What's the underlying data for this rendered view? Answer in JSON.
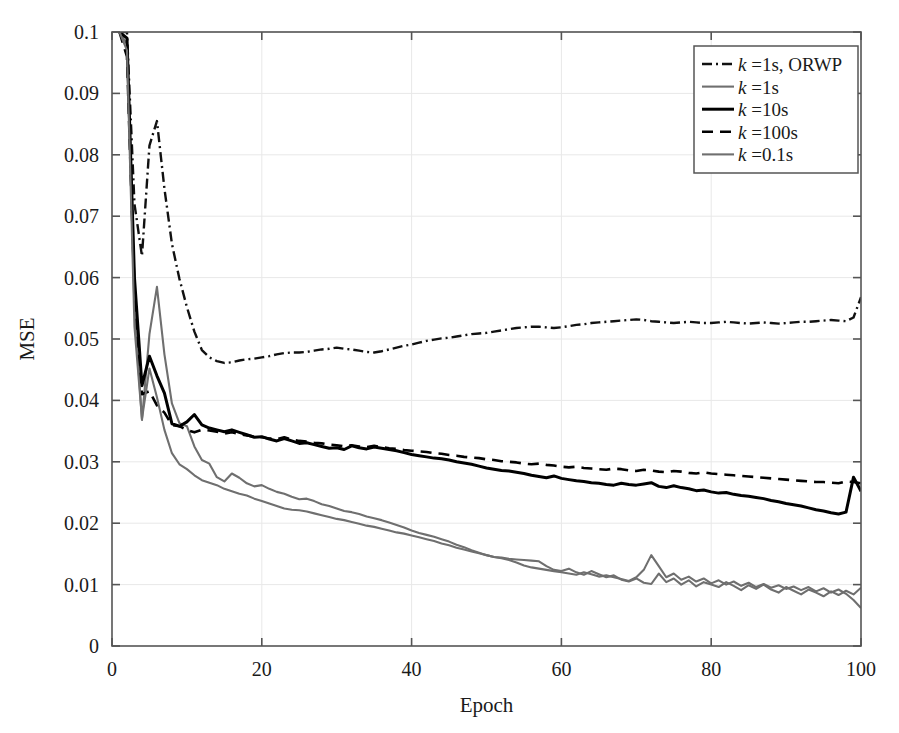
{
  "chart_data": {
    "type": "line",
    "title": "",
    "xlabel": "Epoch",
    "ylabel": "MSE",
    "xlim": [
      0,
      100
    ],
    "ylim": [
      0,
      0.1
    ],
    "xticks": [
      0,
      20,
      40,
      60,
      80,
      100
    ],
    "yticks": [
      0,
      0.01,
      0.02,
      0.03,
      0.04,
      0.05,
      0.06,
      0.07,
      0.08,
      0.09,
      0.1
    ],
    "xtick_labels": [
      "0",
      "20",
      "40",
      "60",
      "80",
      "100"
    ],
    "ytick_labels": [
      "0",
      "0.01",
      "0.02",
      "0.03",
      "0.04",
      "0.05",
      "0.06",
      "0.07",
      "0.08",
      "0.09",
      "0.1"
    ],
    "grid": true,
    "grid_color": "#e8e8e8",
    "axis_color": "#555555",
    "background": "#ffffff",
    "legend_position": "top-right",
    "x": [
      1,
      2,
      3,
      4,
      5,
      6,
      7,
      8,
      9,
      10,
      11,
      12,
      13,
      14,
      15,
      16,
      17,
      18,
      19,
      20,
      21,
      22,
      23,
      24,
      25,
      26,
      27,
      28,
      29,
      30,
      31,
      32,
      33,
      34,
      35,
      36,
      37,
      38,
      39,
      40,
      41,
      42,
      43,
      44,
      45,
      46,
      47,
      48,
      49,
      50,
      51,
      52,
      53,
      54,
      55,
      56,
      57,
      58,
      59,
      60,
      61,
      62,
      63,
      64,
      65,
      66,
      67,
      68,
      69,
      70,
      71,
      72,
      73,
      74,
      75,
      76,
      77,
      78,
      79,
      80,
      81,
      82,
      83,
      84,
      85,
      86,
      87,
      88,
      89,
      90,
      91,
      92,
      93,
      94,
      95,
      96,
      97,
      98,
      99,
      100
    ],
    "series": [
      {
        "name": "k =1s, ORWP",
        "label_k": "k",
        "label_rest": " =1s, ORWP",
        "color": "#111111",
        "width": 2.4,
        "dash": "10,4,2,4",
        "values": [
          0.148,
          0.101,
          0.072,
          0.0635,
          0.0815,
          0.0855,
          0.0745,
          0.0655,
          0.0598,
          0.0552,
          0.0512,
          0.0482,
          0.047,
          0.0464,
          0.0461,
          0.0462,
          0.0465,
          0.0467,
          0.0468,
          0.047,
          0.0472,
          0.0475,
          0.0477,
          0.0478,
          0.0478,
          0.0479,
          0.0481,
          0.0483,
          0.0484,
          0.0486,
          0.0484,
          0.0483,
          0.0481,
          0.0479,
          0.0478,
          0.048,
          0.0483,
          0.0486,
          0.0489,
          0.0491,
          0.0494,
          0.0497,
          0.0499,
          0.0501,
          0.0502,
          0.0504,
          0.0506,
          0.0508,
          0.0509,
          0.051,
          0.0512,
          0.0514,
          0.0516,
          0.0518,
          0.0519,
          0.052,
          0.052,
          0.0519,
          0.0518,
          0.0519,
          0.0521,
          0.0523,
          0.0524,
          0.0526,
          0.0527,
          0.0528,
          0.0529,
          0.053,
          0.0531,
          0.0532,
          0.0531,
          0.0529,
          0.0528,
          0.0527,
          0.0526,
          0.0527,
          0.0528,
          0.0527,
          0.0526,
          0.0526,
          0.0527,
          0.0528,
          0.0527,
          0.0526,
          0.0525,
          0.0526,
          0.0527,
          0.0526,
          0.0525,
          0.0526,
          0.0527,
          0.0528,
          0.0528,
          0.0529,
          0.053,
          0.0531,
          0.053,
          0.0529,
          0.0535,
          0.0568
        ]
      },
      {
        "name": "k =1s",
        "label_k": "k",
        "label_rest": " =1s",
        "color": "#6f6f6f",
        "width": 2.1,
        "dash": "none",
        "values": [
          0.139,
          0.098,
          0.055,
          0.0368,
          0.0508,
          0.0585,
          0.0475,
          0.0395,
          0.0363,
          0.0358,
          0.0325,
          0.0303,
          0.0297,
          0.0275,
          0.0268,
          0.0281,
          0.0274,
          0.0265,
          0.026,
          0.0262,
          0.0256,
          0.0251,
          0.0248,
          0.0243,
          0.0239,
          0.024,
          0.0236,
          0.0231,
          0.0228,
          0.0224,
          0.022,
          0.0218,
          0.0215,
          0.0211,
          0.0208,
          0.0205,
          0.0201,
          0.0197,
          0.0193,
          0.0188,
          0.0184,
          0.0181,
          0.0178,
          0.0174,
          0.017,
          0.0165,
          0.0161,
          0.0156,
          0.0152,
          0.0148,
          0.0145,
          0.0144,
          0.0142,
          0.0141,
          0.014,
          0.0139,
          0.0138,
          0.013,
          0.0124,
          0.0122,
          0.0126,
          0.012,
          0.0116,
          0.0122,
          0.0117,
          0.0112,
          0.0115,
          0.0108,
          0.0105,
          0.011,
          0.0103,
          0.0101,
          0.0118,
          0.0104,
          0.011,
          0.01,
          0.0107,
          0.0097,
          0.0104,
          0.01,
          0.0096,
          0.0104,
          0.0098,
          0.0091,
          0.0099,
          0.0093,
          0.01,
          0.0092,
          0.0087,
          0.0096,
          0.009,
          0.0084,
          0.0092,
          0.0087,
          0.0081,
          0.0089,
          0.0083,
          0.009,
          0.0084,
          0.0095
        ]
      },
      {
        "name": "k =10s",
        "label_k": "k",
        "label_rest": " =10s",
        "color": "#000000",
        "width": 3.0,
        "dash": "none",
        "values": [
          0.142,
          0.099,
          0.06,
          0.0424,
          0.0472,
          0.044,
          0.0412,
          0.0362,
          0.0358,
          0.0365,
          0.0377,
          0.036,
          0.0355,
          0.0352,
          0.0349,
          0.0352,
          0.0348,
          0.0344,
          0.034,
          0.0341,
          0.0337,
          0.0334,
          0.0338,
          0.0334,
          0.033,
          0.0331,
          0.0328,
          0.0325,
          0.0322,
          0.0323,
          0.032,
          0.0326,
          0.0323,
          0.0321,
          0.0324,
          0.0322,
          0.032,
          0.0318,
          0.0315,
          0.0312,
          0.031,
          0.0308,
          0.0306,
          0.0305,
          0.0303,
          0.03,
          0.0298,
          0.0296,
          0.0293,
          0.029,
          0.0288,
          0.0286,
          0.0285,
          0.0283,
          0.0281,
          0.0278,
          0.0276,
          0.0274,
          0.0277,
          0.0273,
          0.0271,
          0.0269,
          0.0268,
          0.0266,
          0.0265,
          0.0263,
          0.0262,
          0.0265,
          0.0263,
          0.0262,
          0.0264,
          0.0266,
          0.026,
          0.0258,
          0.0261,
          0.0258,
          0.0256,
          0.0253,
          0.0254,
          0.0251,
          0.0249,
          0.025,
          0.0247,
          0.0245,
          0.0244,
          0.0242,
          0.024,
          0.0237,
          0.0235,
          0.0232,
          0.023,
          0.0228,
          0.0225,
          0.0222,
          0.022,
          0.0217,
          0.0215,
          0.0218,
          0.0275,
          0.0252
        ]
      },
      {
        "name": "k =100s",
        "label_k": "k",
        "label_rest": " =100s",
        "color": "#000000",
        "width": 2.6,
        "dash": "11,7",
        "values": [
          0.133,
          0.096,
          0.058,
          0.041,
          0.0415,
          0.0392,
          0.038,
          0.036,
          0.0358,
          0.0352,
          0.0348,
          0.0352,
          0.0351,
          0.0349,
          0.0346,
          0.0348,
          0.0345,
          0.0343,
          0.0341,
          0.034,
          0.0338,
          0.0337,
          0.034,
          0.0336,
          0.0334,
          0.0333,
          0.0331,
          0.033,
          0.0328,
          0.0327,
          0.0325,
          0.0327,
          0.0325,
          0.0324,
          0.0326,
          0.0324,
          0.0322,
          0.0321,
          0.0319,
          0.0318,
          0.0317,
          0.0316,
          0.0314,
          0.0313,
          0.0311,
          0.031,
          0.0308,
          0.0307,
          0.0306,
          0.0304,
          0.0303,
          0.0301,
          0.03,
          0.0299,
          0.0297,
          0.0296,
          0.0297,
          0.0295,
          0.0294,
          0.0292,
          0.0291,
          0.0292,
          0.029,
          0.0289,
          0.0288,
          0.0287,
          0.0289,
          0.0288,
          0.0286,
          0.0285,
          0.0287,
          0.0286,
          0.0284,
          0.0283,
          0.0285,
          0.0284,
          0.0282,
          0.0281,
          0.0283,
          0.0281,
          0.028,
          0.0279,
          0.0278,
          0.0277,
          0.0276,
          0.0275,
          0.0274,
          0.0273,
          0.0272,
          0.0271,
          0.027,
          0.0269,
          0.0268,
          0.0267,
          0.0267,
          0.0266,
          0.0265,
          0.0268,
          0.0267,
          0.0265
        ]
      },
      {
        "name": "k =0.1s",
        "label_k": "k",
        "label_rest": " =0.1s",
        "color": "#6f6f6f",
        "width": 2.1,
        "dash": "none",
        "values": [
          0.135,
          0.097,
          0.052,
          0.037,
          0.0452,
          0.0405,
          0.0352,
          0.0314,
          0.0296,
          0.0288,
          0.0278,
          0.027,
          0.0266,
          0.0262,
          0.0256,
          0.0252,
          0.0248,
          0.0245,
          0.024,
          0.0236,
          0.0232,
          0.0228,
          0.0224,
          0.0222,
          0.0221,
          0.0219,
          0.0216,
          0.0213,
          0.021,
          0.0207,
          0.0205,
          0.0202,
          0.0199,
          0.0196,
          0.0194,
          0.0191,
          0.0188,
          0.0185,
          0.0183,
          0.018,
          0.0177,
          0.0174,
          0.0171,
          0.0167,
          0.0164,
          0.016,
          0.0157,
          0.0154,
          0.0151,
          0.0148,
          0.0145,
          0.0143,
          0.014,
          0.0136,
          0.0131,
          0.0128,
          0.0126,
          0.0124,
          0.0122,
          0.012,
          0.0118,
          0.0116,
          0.012,
          0.0117,
          0.0113,
          0.0115,
          0.0112,
          0.0109,
          0.0106,
          0.0112,
          0.0124,
          0.0148,
          0.013,
          0.0112,
          0.0118,
          0.0108,
          0.0113,
          0.0105,
          0.011,
          0.0102,
          0.0107,
          0.01,
          0.0105,
          0.0098,
          0.0103,
          0.0096,
          0.0101,
          0.0095,
          0.0099,
          0.0093,
          0.0097,
          0.0091,
          0.0096,
          0.0089,
          0.0094,
          0.0087,
          0.0092,
          0.0085,
          0.0075,
          0.0062
        ]
      }
    ]
  }
}
